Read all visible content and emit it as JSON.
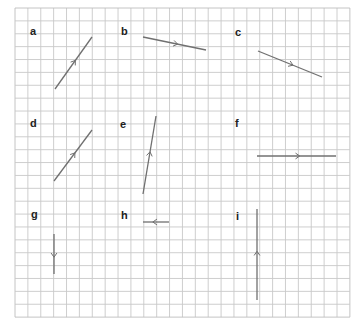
{
  "figure": {
    "grid": {
      "origin_x": 15,
      "origin_y": 8,
      "cols": 26,
      "rows": 24,
      "cell": 12.88,
      "line_color": "#c8c8c8",
      "border_color": "#bdbdbd"
    },
    "line_color": "#707070",
    "panels": [
      {
        "label": "a",
        "label_x": 30,
        "label_y": 35,
        "x1": 55,
        "y1": 89,
        "x2": 92,
        "y2": 37,
        "arrow": "toward-end"
      },
      {
        "label": "b",
        "label_x": 121,
        "label_y": 35,
        "x1": 143,
        "y1": 37,
        "x2": 206,
        "y2": 50,
        "arrow": "toward-end"
      },
      {
        "label": "c",
        "label_x": 235,
        "label_y": 36,
        "x1": 258,
        "y1": 51,
        "x2": 322,
        "y2": 77,
        "arrow": "toward-end"
      },
      {
        "label": "d",
        "label_x": 30,
        "label_y": 127,
        "x1": 54,
        "y1": 181,
        "x2": 92,
        "y2": 130,
        "arrow": "toward-end"
      },
      {
        "label": "e",
        "label_x": 120,
        "label_y": 128,
        "x1": 143,
        "y1": 194,
        "x2": 156,
        "y2": 116,
        "arrow": "toward-end"
      },
      {
        "label": "f",
        "label_x": 235,
        "label_y": 127,
        "x1": 257,
        "y1": 156,
        "x2": 336,
        "y2": 156,
        "arrow": "toward-end"
      },
      {
        "label": "g",
        "label_x": 31,
        "label_y": 218,
        "x1": 54,
        "y1": 234,
        "x2": 54,
        "y2": 274,
        "arrow": "toward-end"
      },
      {
        "label": "h",
        "label_x": 121,
        "label_y": 219,
        "x1": 169,
        "y1": 222,
        "x2": 143,
        "y2": 222,
        "arrow": "toward-end"
      },
      {
        "label": "i",
        "label_x": 236,
        "label_y": 220,
        "x1": 257,
        "y1": 300,
        "x2": 257,
        "y2": 209,
        "arrow": "toward-end"
      }
    ]
  }
}
